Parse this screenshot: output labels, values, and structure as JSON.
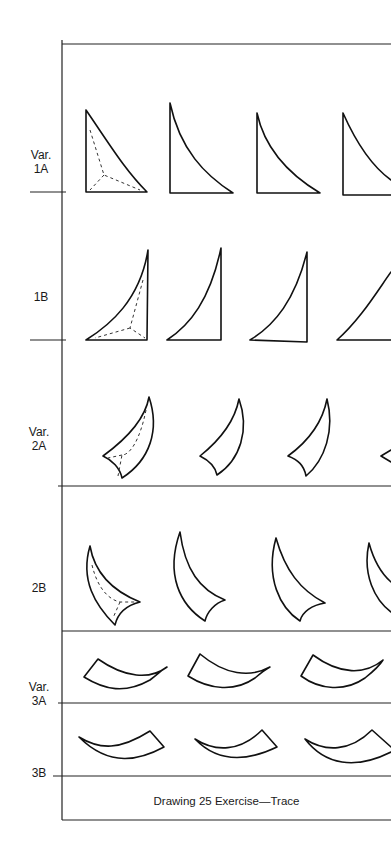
{
  "worksheet": {
    "rows": [
      {
        "id": "1A",
        "label_line1": "Var.",
        "label_line2": "1A"
      },
      {
        "id": "1B",
        "label_line1": "",
        "label_line2": "1B"
      },
      {
        "id": "2A",
        "label_line1": "Var.",
        "label_line2": "2A"
      },
      {
        "id": "2B",
        "label_line1": "",
        "label_line2": "2B"
      },
      {
        "id": "3A",
        "label_line1": "Var.",
        "label_line2": "3A"
      },
      {
        "id": "3B",
        "label_line1": "",
        "label_line2": "3B"
      }
    ],
    "caption": "Drawing 25 Exercise—Trace"
  }
}
